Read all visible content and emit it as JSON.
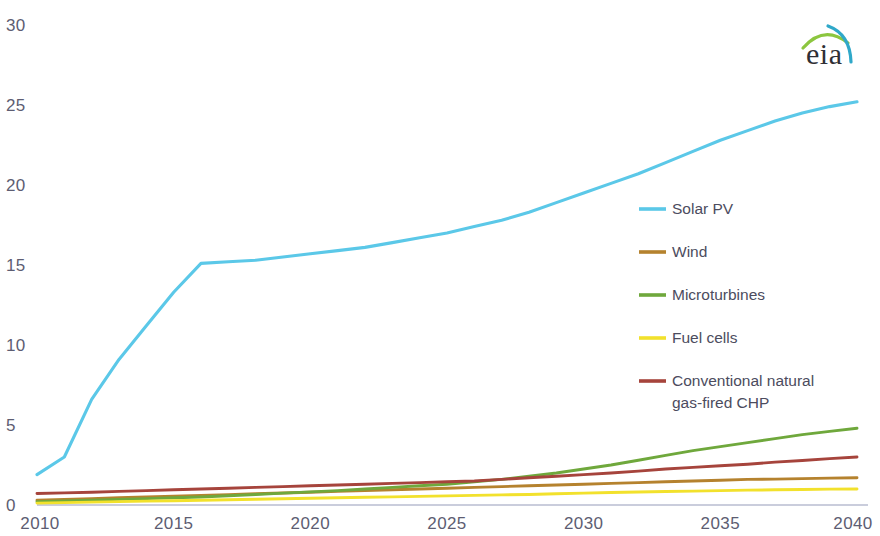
{
  "logo": {
    "text": "eia",
    "arc_colors": [
      "#8cc63f",
      "#2fa8c9"
    ],
    "name": "eia-logo"
  },
  "chart_data": {
    "type": "line",
    "title": "",
    "subtitle": "",
    "xlabel": "",
    "ylabel": "",
    "xlim": [
      2010,
      2040
    ],
    "ylim": [
      0,
      30
    ],
    "xticks": [
      2010,
      2015,
      2020,
      2025,
      2030,
      2035,
      2040
    ],
    "yticks": [
      0,
      5,
      10,
      15,
      20,
      25,
      30
    ],
    "grid": false,
    "legend_position": "center-right",
    "x": [
      2010,
      2011,
      2012,
      2013,
      2014,
      2015,
      2016,
      2017,
      2018,
      2019,
      2020,
      2021,
      2022,
      2023,
      2024,
      2025,
      2026,
      2027,
      2028,
      2029,
      2030,
      2031,
      2032,
      2033,
      2034,
      2035,
      2036,
      2037,
      2038,
      2039,
      2040
    ],
    "series": [
      {
        "name": "Solar PV",
        "color": "#5bc8e8",
        "values": [
          1.9,
          3.0,
          6.6,
          9.1,
          11.2,
          13.3,
          15.1,
          15.2,
          15.3,
          15.5,
          15.7,
          15.9,
          16.1,
          16.4,
          16.7,
          17.0,
          17.4,
          17.8,
          18.3,
          18.9,
          19.5,
          20.1,
          20.7,
          21.4,
          22.1,
          22.8,
          23.4,
          24.0,
          24.5,
          24.9,
          25.2
        ]
      },
      {
        "name": "Wind",
        "color": "#b5822e",
        "values": [
          0.3,
          0.35,
          0.4,
          0.45,
          0.5,
          0.55,
          0.6,
          0.65,
          0.7,
          0.75,
          0.8,
          0.85,
          0.9,
          0.95,
          1.0,
          1.05,
          1.1,
          1.15,
          1.2,
          1.25,
          1.3,
          1.35,
          1.4,
          1.45,
          1.5,
          1.55,
          1.6,
          1.62,
          1.65,
          1.68,
          1.7
        ]
      },
      {
        "name": "Microturbines",
        "color": "#6fa83c",
        "values": [
          0.2,
          0.25,
          0.3,
          0.35,
          0.4,
          0.45,
          0.5,
          0.58,
          0.66,
          0.74,
          0.82,
          0.9,
          1.0,
          1.1,
          1.2,
          1.3,
          1.45,
          1.6,
          1.8,
          2.0,
          2.25,
          2.5,
          2.8,
          3.1,
          3.4,
          3.65,
          3.9,
          4.15,
          4.4,
          4.6,
          4.8
        ]
      },
      {
        "name": "Fuel cells",
        "color": "#f2e12c",
        "values": [
          0.12,
          0.15,
          0.18,
          0.21,
          0.24,
          0.27,
          0.3,
          0.33,
          0.36,
          0.39,
          0.42,
          0.45,
          0.48,
          0.51,
          0.54,
          0.57,
          0.6,
          0.63,
          0.66,
          0.7,
          0.74,
          0.78,
          0.81,
          0.84,
          0.87,
          0.9,
          0.93,
          0.95,
          0.97,
          0.99,
          1.0
        ]
      },
      {
        "name": "Conventional natural gas-fired CHP",
        "color": "#a6443c",
        "values": [
          0.72,
          0.76,
          0.8,
          0.85,
          0.9,
          0.95,
          1.0,
          1.05,
          1.1,
          1.15,
          1.2,
          1.25,
          1.3,
          1.35,
          1.4,
          1.45,
          1.5,
          1.6,
          1.7,
          1.8,
          1.9,
          2.0,
          2.12,
          2.25,
          2.35,
          2.45,
          2.55,
          2.68,
          2.78,
          2.9,
          3.0
        ]
      }
    ],
    "legend": [
      {
        "label": "Solar PV",
        "color": "#5bc8e8"
      },
      {
        "label": "Wind",
        "color": "#b5822e"
      },
      {
        "label": "Microturbines",
        "color": "#6fa83c"
      },
      {
        "label": "Fuel cells",
        "color": "#f2e12c"
      },
      {
        "label": "Conventional natural",
        "color": "#a6443c"
      },
      {
        "label": "gas-fired CHP",
        "color": ""
      }
    ]
  }
}
